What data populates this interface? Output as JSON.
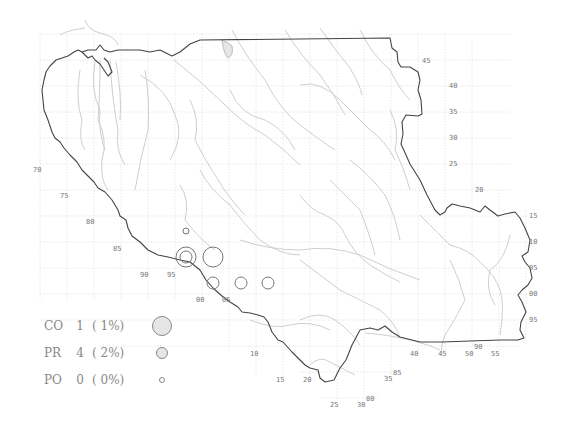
{
  "legend": {
    "items": [
      {
        "code": "CO",
        "count": "1",
        "pct": "( 1%)",
        "symbol_diameter": 20
      },
      {
        "code": "PR",
        "count": "4",
        "pct": "( 2%)",
        "symbol_diameter": 12
      },
      {
        "code": "PO",
        "count": "0",
        "pct": "( 0%)",
        "symbol_diameter": 6
      }
    ]
  },
  "colors": {
    "boundary": "#444444",
    "rivers": "#c8c8c8",
    "grid": "#e2e2e2",
    "tick_labels": "#777777",
    "symbol_fill": "#e6e6e6",
    "symbol_stroke": "#777777"
  },
  "tick_labels": {
    "left": [
      {
        "text": "70",
        "x": 33,
        "y": 172
      },
      {
        "text": "75",
        "x": 60,
        "y": 198
      },
      {
        "text": "80",
        "x": 86,
        "y": 224
      },
      {
        "text": "85",
        "x": 113,
        "y": 251
      },
      {
        "text": "90",
        "x": 140,
        "y": 277
      },
      {
        "text": "95",
        "x": 167,
        "y": 277
      },
      {
        "text": "00",
        "x": 196,
        "y": 302
      },
      {
        "text": "05",
        "x": 222,
        "y": 302
      },
      {
        "text": "10",
        "x": 250,
        "y": 356
      },
      {
        "text": "15",
        "x": 276,
        "y": 382
      },
      {
        "text": "20",
        "x": 303,
        "y": 382
      },
      {
        "text": "25",
        "x": 330,
        "y": 407
      },
      {
        "text": "30",
        "x": 357,
        "y": 407
      },
      {
        "text": "80",
        "x": 366,
        "y": 401
      },
      {
        "text": "35",
        "x": 384,
        "y": 381
      },
      {
        "text": "85",
        "x": 393,
        "y": 375
      },
      {
        "text": "40",
        "x": 410,
        "y": 356
      },
      {
        "text": "45",
        "x": 438,
        "y": 356
      },
      {
        "text": "50",
        "x": 465,
        "y": 356
      },
      {
        "text": "90",
        "x": 474,
        "y": 349
      },
      {
        "text": "55",
        "x": 491,
        "y": 356
      }
    ],
    "right": [
      {
        "text": "45",
        "x": 422,
        "y": 63
      },
      {
        "text": "40",
        "x": 449,
        "y": 88
      },
      {
        "text": "35",
        "x": 449,
        "y": 114
      },
      {
        "text": "30",
        "x": 449,
        "y": 140
      },
      {
        "text": "25",
        "x": 449,
        "y": 166
      },
      {
        "text": "20",
        "x": 475,
        "y": 192
      },
      {
        "text": "15",
        "x": 529,
        "y": 218
      },
      {
        "text": "10",
        "x": 529,
        "y": 244
      },
      {
        "text": "05",
        "x": 529,
        "y": 270
      },
      {
        "text": "00",
        "x": 529,
        "y": 296
      },
      {
        "text": "95",
        "x": 529,
        "y": 322
      }
    ]
  },
  "markers": [
    {
      "type": "PO",
      "x": 186,
      "y": 231,
      "r": 3
    },
    {
      "type": "CO",
      "x": 186,
      "y": 257,
      "r": 10
    },
    {
      "type": "PR",
      "x": 186,
      "y": 257,
      "r": 6
    },
    {
      "type": "CO",
      "x": 213,
      "y": 257,
      "r": 10
    },
    {
      "type": "PR",
      "x": 213,
      "y": 283,
      "r": 6
    },
    {
      "type": "PR",
      "x": 241,
      "y": 283,
      "r": 6
    },
    {
      "type": "PR",
      "x": 268,
      "y": 283,
      "r": 6
    }
  ]
}
